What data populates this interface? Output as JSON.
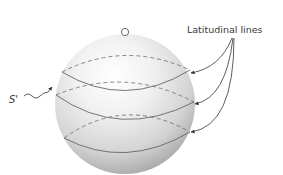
{
  "diagram": {
    "title": "",
    "labels": {
      "latitudinal_lines": "Latitudinal lines",
      "surface": "S'"
    },
    "colors": {
      "background": "#ffffff",
      "sphere_light": "#fafafa",
      "sphere_mid": "#d9d9d9",
      "sphere_dark": "#9a9a9a",
      "line": "#555555",
      "text": "#3a3a3a"
    },
    "elements": {
      "sphere": {
        "cx": 125,
        "cy": 104,
        "r": 70
      },
      "pole_marker": {
        "cx": 125,
        "cy": 32,
        "r": 4
      },
      "latitude_count": 3
    }
  }
}
